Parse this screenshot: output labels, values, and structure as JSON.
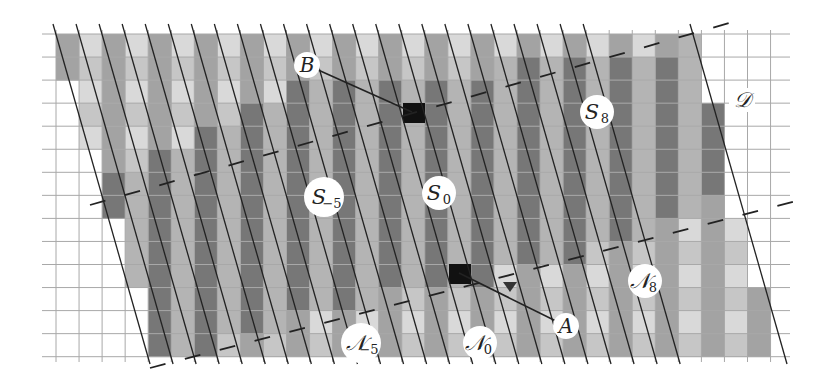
{
  "figure": {
    "width": 817,
    "height": 385,
    "grid": {
      "x0": 56,
      "y0": 34,
      "cell": 23.05,
      "cols": 31,
      "rows": 14,
      "line_color": "#a8a8a8",
      "extend_left": 42,
      "extend_right": 790,
      "extend_top": 30,
      "extend_bottom": 362
    },
    "colors": {
      "light": "#d9d9d9",
      "light_alt": "#c6c6c6",
      "mid": "#b4b4b4",
      "mid_alt": "#a3a3a3",
      "dark": "#8e8e8e",
      "dark_alt": "#777777",
      "black": "#111111",
      "line": "#222222",
      "dash": "#222222"
    },
    "region_rows": [
      {
        "row": 0,
        "start": 0,
        "end": 27,
        "band": "N"
      },
      {
        "row": 1,
        "start": 0,
        "end": 27,
        "band": "N"
      },
      {
        "row": 2,
        "start": 1,
        "end": 27,
        "band": "N"
      },
      {
        "row": 3,
        "start": 1,
        "end": 28,
        "band": "N"
      },
      {
        "row": 4,
        "start": 1,
        "end": 28,
        "band": "N"
      },
      {
        "row": 5,
        "start": 2,
        "end": 28,
        "band": "N"
      },
      {
        "row": 6,
        "start": 2,
        "end": 28,
        "band": "N"
      },
      {
        "row": 7,
        "start": 2,
        "end": 28,
        "band": "N"
      },
      {
        "row": 8,
        "start": 3,
        "end": 29,
        "band": "N"
      },
      {
        "row": 9,
        "start": 3,
        "end": 29,
        "band": "N"
      },
      {
        "row": 10,
        "start": 3,
        "end": 29,
        "band": "N"
      },
      {
        "row": 11,
        "start": 4,
        "end": 30,
        "band": "N"
      },
      {
        "row": 12,
        "start": 4,
        "end": 30,
        "band": "N"
      },
      {
        "row": 13,
        "start": 4,
        "end": 30,
        "band": "N"
      }
    ],
    "dark_band": {
      "description": "dark checker region S between dashed boundary rows",
      "rows": [
        {
          "row": 0,
          "start": 27,
          "end": 27
        },
        {
          "row": 1,
          "start": 19,
          "end": 27
        },
        {
          "row": 2,
          "start": 10,
          "end": 28
        },
        {
          "row": 3,
          "start": 8,
          "end": 28
        },
        {
          "row": 4,
          "start": 6,
          "end": 28
        },
        {
          "row": 5,
          "start": 4,
          "end": 28
        },
        {
          "row": 6,
          "start": 2,
          "end": 29
        },
        {
          "row": 7,
          "start": 2,
          "end": 27
        },
        {
          "row": 8,
          "start": 3,
          "end": 25
        },
        {
          "row": 9,
          "start": 3,
          "end": 22
        },
        {
          "row": 10,
          "start": 3,
          "end": 18
        },
        {
          "row": 11,
          "start": 4,
          "end": 13
        },
        {
          "row": 12,
          "start": 4,
          "end": 9
        },
        {
          "row": 13,
          "start": 4,
          "end": 6
        }
      ]
    },
    "slanted_lines": {
      "count": 24,
      "top_y": 24,
      "bottom_y": 364,
      "first_top_x": 53,
      "spacing": 23.05,
      "dx": 97
    },
    "boundary_line": {
      "top_x": 690,
      "top_y": 24,
      "bottom_x": 787,
      "bottom_y": 364
    },
    "dashed_line": {
      "x1": 150,
      "y1": 368,
      "x2": 800,
      "y2": 200,
      "x3": 90,
      "y3": 205,
      "x4": 740,
      "y4": 20
    },
    "markers": [
      {
        "id": "B",
        "label": "B",
        "cx": 307,
        "cy": 65,
        "target_x": 412,
        "target_y": 112
      },
      {
        "id": "A",
        "label": "A",
        "cx": 566,
        "cy": 326,
        "target_x": 459,
        "target_y": 273
      }
    ],
    "black_cells": [
      {
        "x": 403,
        "y": 103,
        "w": 22,
        "h": 20
      },
      {
        "x": 449,
        "y": 264,
        "w": 22,
        "h": 20
      }
    ],
    "triangle_marker": {
      "x": 510,
      "y": 287
    },
    "region_labels": [
      {
        "id": "S-5",
        "main": "S",
        "sub": "−5",
        "cx": 324,
        "cy": 197
      },
      {
        "id": "S0",
        "main": "S",
        "sub": "0",
        "cx": 439,
        "cy": 193
      },
      {
        "id": "S8",
        "main": "S",
        "sub": "8",
        "cx": 597,
        "cy": 112
      },
      {
        "id": "N-5",
        "main": "𝒩",
        "sub": "−5",
        "cx": 361,
        "cy": 343
      },
      {
        "id": "N0",
        "main": "𝒩",
        "sub": "0",
        "cx": 480,
        "cy": 343
      },
      {
        "id": "N8",
        "main": "𝒩",
        "sub": "8",
        "cx": 645,
        "cy": 281
      },
      {
        "id": "D",
        "main": "𝒟",
        "sub": "",
        "cx": 742,
        "cy": 100
      }
    ]
  }
}
